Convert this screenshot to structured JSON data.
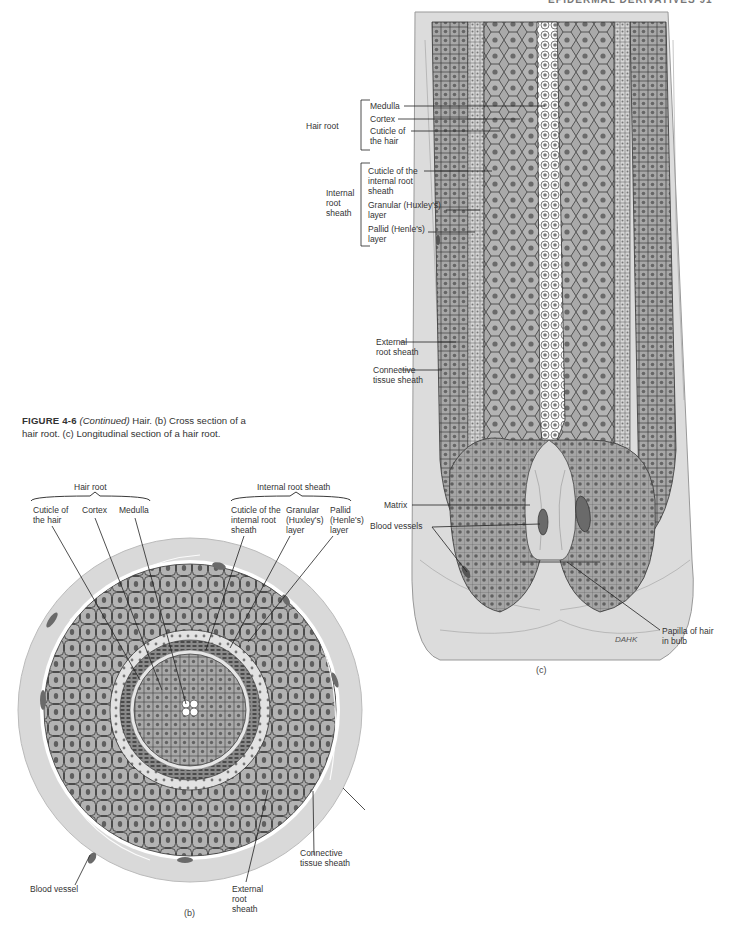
{
  "page": {
    "running_head": "EPIDERMAL DERIVATIVES   91"
  },
  "caption": {
    "figure_number": "FIGURE 4-6",
    "continued": "(Continued)",
    "text": " Hair. (b) Cross section of a hair root. (c) Longitudinal section of a hair root."
  },
  "panel_c": {
    "letter": "(c)",
    "group_hair_root": "Hair root",
    "group_internal_root_sheath": "Internal root sheath",
    "labels": {
      "medulla": "Medulla",
      "cortex": "Cortex",
      "cuticle_hair": "Cuticle of the hair",
      "cuticle_irs": "Cuticle of the internal root sheath",
      "granular": "Granular (Huxley's) layer",
      "pallid": "Pallid (Henle's) layer",
      "external_root_sheath": "External root sheath",
      "connective_tissue_sheath": "Connective tissue sheath",
      "matrix": "Matrix",
      "blood_vessels": "Blood vessels",
      "papilla": "Papilla of hair in bulb"
    },
    "signature": "DAHK"
  },
  "panel_b": {
    "letter": "(b)",
    "group_hair_root": "Hair root",
    "group_internal_root_sheath": "Internal root sheath",
    "labels": {
      "cuticle_hair": "Cuticle of the hair",
      "cortex": "Cortex",
      "medulla": "Medulla",
      "cuticle_irs": "Cuticle of the internal root sheath",
      "granular": "Granular (Huxley's) layer",
      "pallid": "Pallid (Henle's) layer",
      "connective_tissue_sheath": "Connective tissue sheath",
      "external_root_sheath": "External root sheath",
      "blood_vessel": "Blood vessel"
    }
  }
}
